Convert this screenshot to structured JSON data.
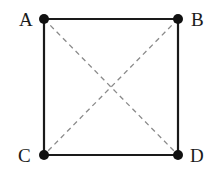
{
  "diagram": {
    "type": "square-with-diagonals",
    "vertices": [
      {
        "id": "A",
        "label": "A",
        "x": 44,
        "y": 19
      },
      {
        "id": "B",
        "label": "B",
        "x": 178,
        "y": 19
      },
      {
        "id": "C",
        "label": "C",
        "x": 44,
        "y": 155
      },
      {
        "id": "D",
        "label": "D",
        "x": 178,
        "y": 155
      }
    ],
    "edges_solid": [
      [
        "A",
        "B"
      ],
      [
        "B",
        "D"
      ],
      [
        "D",
        "C"
      ],
      [
        "C",
        "A"
      ]
    ],
    "edges_dashed": [
      [
        "A",
        "D"
      ],
      [
        "B",
        "C"
      ]
    ],
    "colors": {
      "solid_edge": "#1a1a1a",
      "dashed_edge": "#8a8a8a",
      "vertex": "#111111",
      "label": "#1a1a1a"
    }
  }
}
